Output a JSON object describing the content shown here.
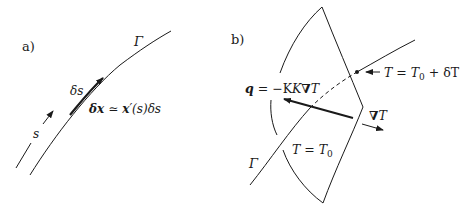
{
  "panel_a": {
    "label": "a)",
    "curve_label": "Γ",
    "param_label": "s",
    "element_label": "δs",
    "equation": {
      "lhs": "δx",
      "rel": "≃",
      "rhs_vec": "x",
      "rhs_rest": "′(s)δs"
    }
  },
  "panel_b": {
    "label": "b)",
    "curve_label": "Γ",
    "isotherm_low": "T = T",
    "isotherm_low_sub": "0",
    "isotherm_high_pre": "T = T",
    "isotherm_high_sub": "0",
    "isotherm_high_post": " + δT",
    "flux": {
      "q": "q",
      "eq": " = −K",
      "grad": "∇",
      "T": "T"
    },
    "gradient": {
      "grad": "∇",
      "T": "T"
    }
  },
  "colors": {
    "stroke": "#1a1a1a",
    "background": "#ffffff"
  }
}
